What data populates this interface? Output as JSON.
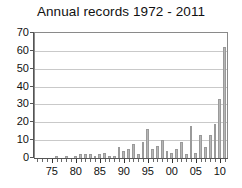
{
  "chart_data": {
    "type": "bar",
    "title": "Annual records 1972 - 2011",
    "xlabel": "",
    "ylabel": "",
    "ylim": [
      0,
      70
    ],
    "yticks": [
      0,
      10,
      20,
      30,
      40,
      50,
      60,
      70
    ],
    "grid": true,
    "legend": null,
    "bar_color": "#b6b6b6",
    "bar_edge_color": "#9a9a9a",
    "axis_color": "#555555",
    "grid_color": "#c9c9c9",
    "text_color": "#111111",
    "categories": [
      "1972",
      "1973",
      "1974",
      "1975",
      "1976",
      "1977",
      "1978",
      "1979",
      "1980",
      "1981",
      "1982",
      "1983",
      "1984",
      "1985",
      "1986",
      "1987",
      "1988",
      "1989",
      "1990",
      "1991",
      "1992",
      "1993",
      "1994",
      "1995",
      "1996",
      "1997",
      "1998",
      "1999",
      "2000",
      "2001",
      "2002",
      "2003",
      "2004",
      "2005",
      "2006",
      "2007",
      "2008",
      "2009",
      "2010",
      "2011"
    ],
    "values": [
      0,
      0,
      0,
      0,
      1,
      0,
      1,
      0,
      1,
      2,
      2,
      2,
      1,
      2,
      3,
      1,
      1,
      6,
      4,
      5,
      8,
      2,
      9,
      16,
      5,
      7,
      10,
      4,
      3,
      5,
      9,
      2,
      18,
      3,
      13,
      6,
      13,
      19,
      33,
      62
    ],
    "values_tail": [
      54,
      27
    ],
    "xtick_labels": [
      "75",
      "80",
      "85",
      "90",
      "95",
      "00",
      "05",
      "10"
    ],
    "xtick_years": [
      1975,
      1980,
      1985,
      1990,
      1995,
      2000,
      2005,
      2010
    ]
  }
}
